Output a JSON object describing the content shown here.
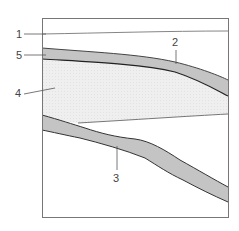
{
  "diagram": {
    "labels": [
      {
        "id": "1",
        "text": "1"
      },
      {
        "id": "2",
        "text": "2"
      },
      {
        "id": "3",
        "text": "3"
      },
      {
        "id": "4",
        "text": "4"
      },
      {
        "id": "5",
        "text": "5"
      }
    ],
    "colors": {
      "band": "#c4c4c4",
      "region": "#ededed",
      "outline": "#444444",
      "frame": "#777777"
    }
  }
}
